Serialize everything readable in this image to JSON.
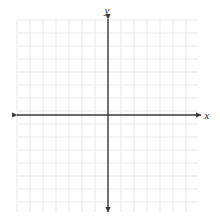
{
  "figure": {
    "kind": "coordinate-plane",
    "title": "",
    "width": 220,
    "height": 221,
    "background_color": "#ffffff"
  },
  "chart_data": {
    "type": "scatter",
    "title": "",
    "xlabel": "x",
    "ylabel": "y",
    "x": [],
    "y": [],
    "series": [],
    "annotations": [],
    "legend": null,
    "legend_position": "none",
    "grid": true,
    "grid_color": "#e9e9e9",
    "grid_step": 13,
    "grid_columns": 14,
    "grid_rows": 15,
    "axis_color": "#3a3a3a",
    "axis_arrows": [
      "left",
      "right",
      "up",
      "down"
    ],
    "origin_px": [
      108,
      115
    ],
    "plot_area_px": {
      "left": 17,
      "top": 20,
      "right": 198,
      "bottom": 212
    },
    "xlim": [
      -7,
      7
    ],
    "ylim": [
      -7,
      7
    ],
    "xtick_labels": [],
    "ytick_labels": [],
    "tick_marks": false
  },
  "labels": {
    "x_axis": "x",
    "y_axis": "y"
  },
  "geometry": {
    "x_axis_line": {
      "x1": 17,
      "y1": 115,
      "x2": 201,
      "y2": 115
    },
    "y_axis_line": {
      "x1": 108,
      "y1": 19,
      "x2": 108,
      "y2": 212
    },
    "x_label_pos": {
      "x": 207,
      "y": 119
    },
    "y_label_pos": {
      "x": 107,
      "y": 14
    }
  }
}
